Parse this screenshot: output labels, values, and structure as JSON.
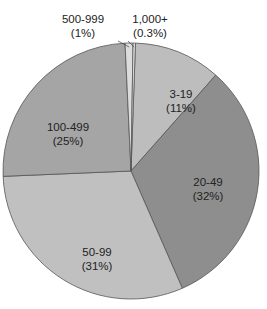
{
  "chart_data": {
    "type": "pie",
    "title": "",
    "start_angle_deg": 2,
    "direction": "clockwise",
    "categories": [
      "3-19",
      "20-49",
      "50-99",
      "100-499",
      "500-999",
      "1,000+"
    ],
    "values": [
      11,
      32,
      31,
      25,
      1,
      0.3
    ],
    "value_labels": [
      "(11%)",
      "(32%)",
      "(31%)",
      "(25%)",
      "(1%)",
      "(0.3%)"
    ],
    "colors": [
      "#bdbdbd",
      "#8e8e8e",
      "#c0c0c0",
      "#a5a5a5",
      "#dcdcdc",
      "#e6e6e6"
    ],
    "label_positions": [
      {
        "x": 181,
        "y": 98
      },
      {
        "x": 208,
        "y": 186
      },
      {
        "x": 97,
        "y": 256
      },
      {
        "x": 68,
        "y": 131
      },
      {
        "x": 83,
        "y": 23,
        "leader": true
      },
      {
        "x": 150,
        "y": 23,
        "leader": true
      }
    ],
    "center": {
      "x": 131,
      "y": 171
    },
    "radius": 128,
    "legend": "none",
    "grid": false
  }
}
